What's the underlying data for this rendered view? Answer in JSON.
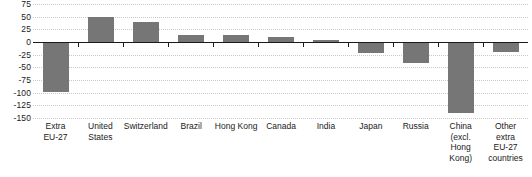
{
  "chart_data": {
    "type": "bar",
    "title": "",
    "subtitle": "",
    "xlabel": "",
    "ylabel": "",
    "ylim": [
      -150,
      75
    ],
    "yticks": [
      75,
      50,
      25,
      0,
      -25,
      -50,
      -75,
      -100,
      -125,
      -150
    ],
    "ytick_labels": [
      "75",
      "50",
      "25",
      "0",
      "-25",
      "-50",
      "-75",
      "-100",
      "-125",
      "-150"
    ],
    "grid": true,
    "legend": "none",
    "orientation": "vertical",
    "bar_color": "#767676",
    "axis_color": "#1a1a1a",
    "gridline_color": "#c9c9c9",
    "categories": [
      "Extra EU-27",
      "United States",
      "Switzerland",
      "Brazil",
      "Hong Kong",
      "Canada",
      "India",
      "Japan",
      "Russia",
      "China (excl. Hong Kong)",
      "Other extra EU-27 countries"
    ],
    "category_labels": [
      "Extra\nEU-27",
      "United\nStates",
      "Switzerland",
      "Brazil",
      "Hong Kong",
      "Canada",
      "India",
      "Japan",
      "Russia",
      "China\n(excl.\nHong\nKong)",
      "Other\nextra\nEU-27\ncountries"
    ],
    "values": [
      -98,
      50,
      39,
      13,
      13,
      10,
      3,
      -22,
      -42,
      -140,
      -20
    ]
  }
}
